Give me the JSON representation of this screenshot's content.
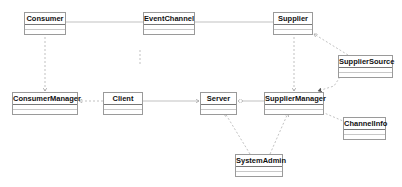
{
  "diagram": {
    "type": "uml-class-diagram",
    "classes": [
      {
        "id": "consumer",
        "name": "Consumer",
        "x": 24,
        "y": 12,
        "w": 42
      },
      {
        "id": "eventchannel",
        "name": "EventChannel",
        "x": 143,
        "y": 12,
        "w": 52
      },
      {
        "id": "supplier",
        "name": "Supplier",
        "x": 273,
        "y": 12,
        "w": 40
      },
      {
        "id": "suppliersource",
        "name": "SupplierSource",
        "x": 338,
        "y": 55,
        "w": 55
      },
      {
        "id": "consumermanager",
        "name": "ConsumerManager",
        "x": 12,
        "y": 92,
        "w": 66
      },
      {
        "id": "client",
        "name": "Client",
        "x": 103,
        "y": 92,
        "w": 40
      },
      {
        "id": "server",
        "name": "Server",
        "x": 200,
        "y": 92,
        "w": 37
      },
      {
        "id": "suppliermanager",
        "name": "SupplierManager",
        "x": 264,
        "y": 92,
        "w": 60
      },
      {
        "id": "channelinfo",
        "name": "ChannelInfo",
        "x": 343,
        "y": 117,
        "w": 43
      },
      {
        "id": "systemadmin",
        "name": "SystemAdmin",
        "x": 235,
        "y": 154,
        "w": 48
      }
    ],
    "edges": [
      {
        "from": "consumer",
        "to": "eventchannel",
        "style": "solid",
        "arrow": "none"
      },
      {
        "from": "eventchannel",
        "to": "supplier",
        "style": "solid",
        "arrow": "none"
      },
      {
        "from": "consumer",
        "to": "consumermanager",
        "style": "dashed",
        "arrow": "open"
      },
      {
        "from": "eventchannel",
        "to": "client",
        "style": "dashed",
        "arrow": "none"
      },
      {
        "from": "client",
        "to": "consumermanager",
        "style": "dashed",
        "arrow": "open"
      },
      {
        "from": "client",
        "to": "server",
        "style": "solid",
        "arrow": "open"
      },
      {
        "from": "suppliermanager",
        "to": "server",
        "style": "solid",
        "arrow": "diamond"
      },
      {
        "from": "supplier",
        "to": "suppliermanager",
        "style": "dashed",
        "arrow": "open"
      },
      {
        "from": "suppliersource",
        "to": "supplier",
        "style": "dashed",
        "arrow": "open"
      },
      {
        "from": "suppliersource",
        "to": "suppliermanager",
        "style": "dashed",
        "arrow": "filled"
      },
      {
        "from": "suppliermanager",
        "to": "channelinfo",
        "style": "dashed",
        "arrow": "none"
      },
      {
        "from": "systemadmin",
        "to": "server",
        "style": "dashed",
        "arrow": "open"
      },
      {
        "from": "systemadmin",
        "to": "suppliermanager",
        "style": "dashed",
        "arrow": "open"
      }
    ]
  }
}
